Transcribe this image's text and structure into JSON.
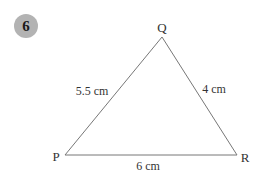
{
  "question": {
    "number": "6",
    "badge_color": "#b3b3b3"
  },
  "triangle": {
    "line_color": "#777777",
    "vertices": {
      "P": {
        "label": "P",
        "x": 65,
        "y": 155
      },
      "Q": {
        "label": "Q",
        "x": 162,
        "y": 37
      },
      "R": {
        "label": "R",
        "x": 237,
        "y": 155
      }
    },
    "sides": {
      "PQ": {
        "label": "5.5 cm",
        "length_cm": 5.5
      },
      "QR": {
        "label": "4 cm",
        "length_cm": 4
      },
      "PR": {
        "label": "6 cm",
        "length_cm": 6
      }
    }
  }
}
